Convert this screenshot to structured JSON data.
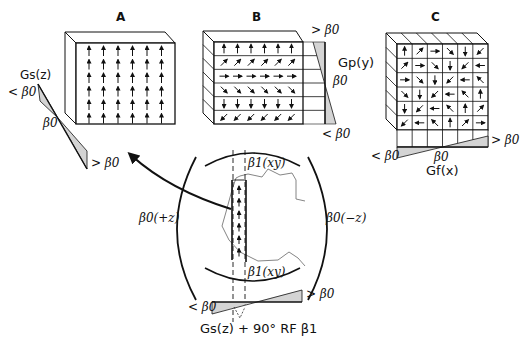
{
  "panels": {
    "A": {
      "title": "A",
      "gradient_label": "Gs(z)",
      "low_label": "< β0",
      "mid_label": "β0",
      "high_label": "> β0",
      "arrows": [
        "up",
        "up",
        "up",
        "up",
        "up",
        "up"
      ],
      "rows": 6,
      "cols": 6,
      "description": "All spins aligned (in phase) after slice selection"
    },
    "B": {
      "title": "B",
      "gradient_label": "Gp(y)",
      "high_label": "> β0",
      "mid_label": "β0",
      "low_label": "< β0",
      "row_arrows": [
        "up",
        "up-right",
        "right",
        "down-right",
        "down",
        "down-left"
      ],
      "cols": 6
    },
    "C": {
      "title": "C",
      "gradient_label": "Gf(x)",
      "low_label": "< β0",
      "mid_label": "β0",
      "high_label": "> β0",
      "grid_arrows": [
        [
          "up",
          "up-right",
          "right",
          "down-right",
          "down",
          "down-left"
        ],
        [
          "up-right",
          "right",
          "down-right",
          "down",
          "down-left",
          "left"
        ],
        [
          "right",
          "down-right",
          "down",
          "down-left",
          "left",
          "up-left"
        ],
        [
          "down-right",
          "down",
          "down-left",
          "left",
          "up-left",
          "up"
        ],
        [
          "down",
          "down-left",
          "left",
          "up-left",
          "up",
          "up-right"
        ],
        [
          "down-left",
          "left",
          "up-left",
          "up",
          "up-right",
          "right"
        ]
      ]
    }
  },
  "center": {
    "top_field_label": "β1(xy)",
    "bottom_field_label": "β1(xy)",
    "left_field_label": "β0(+z)",
    "right_field_label": "β0(−z)",
    "gradient_low_label": "< β0",
    "gradient_high_label": "> β0",
    "caption": "Gs(z) + 90° RF β1",
    "slice_arrows": 6
  },
  "colors": {
    "line": "#111111",
    "shade": "#d4d4d4",
    "outline": "#7a7a7a",
    "background": "#ffffff"
  }
}
